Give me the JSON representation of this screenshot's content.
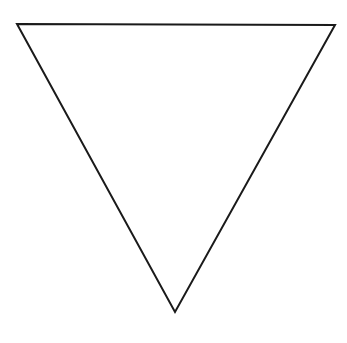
{
  "diagram": {
    "shape": "inverted-triangle",
    "vertices": [
      [
        17,
        24
      ],
      [
        335,
        25
      ],
      [
        175,
        312
      ]
    ],
    "stroke_color": "#1a1a1a",
    "stroke_width": 2,
    "fill_color": "#ffffff",
    "background_color": "#ffffff"
  }
}
